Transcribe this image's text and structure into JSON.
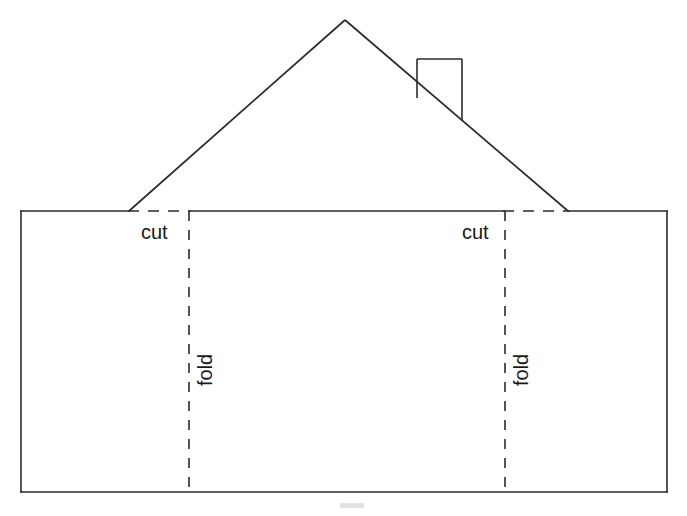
{
  "page": {
    "background_color": "#ffffff",
    "width": 687,
    "height": 516
  },
  "colors": {
    "line": "#2b2b2b",
    "text": "#1a1a1a",
    "gray_mark": "#e2e2e2",
    "background": "#ffffff"
  },
  "diagram": {
    "type": "papercraft-fold-cut-template",
    "base_rectangle": {
      "name": "house-body-rectangle",
      "left": 21,
      "top": 211,
      "right": 667,
      "bottom": 492
    },
    "roof": {
      "name": "roof-triangle",
      "apex_x": 345,
      "apex_y": 20,
      "left_x": 129,
      "left_y": 211,
      "right_x": 568,
      "right_y": 211
    },
    "chimney": {
      "name": "chimney-rectangle",
      "left": 417,
      "right": 462,
      "top": 59,
      "bottom_left_y": 98,
      "bottom_right_y": 121
    },
    "fold_lines": [
      {
        "name": "left-fold-line",
        "x": 189,
        "y_top": 211,
        "y_bottom": 492
      },
      {
        "name": "right-fold-line",
        "x": 505,
        "y_top": 211,
        "y_bottom": 492
      }
    ],
    "cut_dashes": [
      {
        "name": "left-cut-dash",
        "x_start": 128,
        "x_end": 190,
        "y": 211
      },
      {
        "name": "right-cut-dash",
        "x_start": 504,
        "x_end": 570,
        "y": 211
      }
    ],
    "gray_mark": {
      "name": "bottom-gray-mark",
      "x": 340,
      "y": 503,
      "width": 24,
      "height": 5
    }
  },
  "labels": {
    "cut_left": {
      "text": "cut",
      "x": 141,
      "y": 239,
      "rotation": 0
    },
    "cut_right": {
      "text": "cut",
      "x": 462,
      "y": 239,
      "rotation": 0
    },
    "fold_left": {
      "text": "fold",
      "x": 212,
      "y": 386,
      "rotation": -90
    },
    "fold_right": {
      "text": "fold",
      "x": 528,
      "y": 386,
      "rotation": -90
    }
  }
}
